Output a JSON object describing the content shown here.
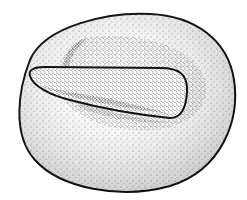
{
  "illustration": {
    "subject": "stone mortar with pestle (stippled drawing)",
    "colors": {
      "background": "#ffffff",
      "ink": "#111111",
      "stipple": "#2a2a2a"
    }
  }
}
